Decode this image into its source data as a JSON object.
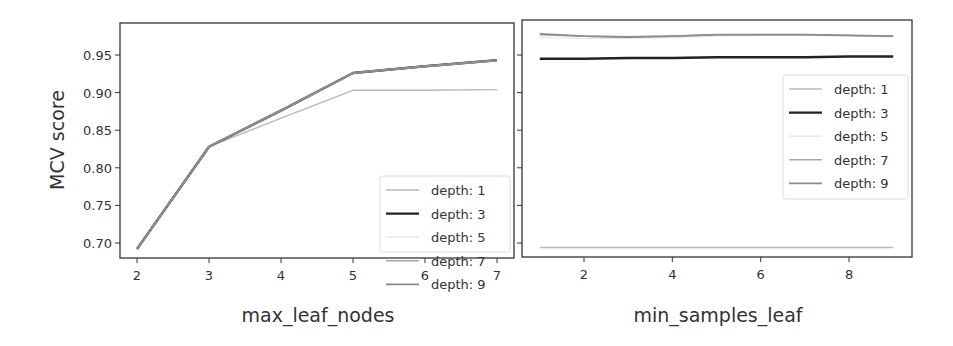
{
  "chart_data": [
    {
      "type": "line",
      "title": "",
      "xlabel": "max_leaf_nodes",
      "ylabel": "MCV score",
      "x": [
        2,
        3,
        4,
        5,
        6,
        7
      ],
      "xticks": [
        "2",
        "3",
        "4",
        "5",
        "6",
        "7"
      ],
      "yticks": [
        "0.70",
        "0.75",
        "0.80",
        "0.85",
        "0.90",
        "0.95"
      ],
      "ylim": [
        0.68,
        0.99
      ],
      "xlim": [
        1.75,
        7.2
      ],
      "grid": false,
      "legend_position": "lower right",
      "series": [
        {
          "name": "depth: 1",
          "color": "#b8b8b8",
          "values": [
            0.692,
            0.828,
            0.866,
            0.903,
            0.903,
            0.904
          ]
        },
        {
          "name": "depth: 3",
          "color": "#222222",
          "values": [
            0.692,
            0.828,
            0.876,
            0.926,
            0.935,
            0.943
          ]
        },
        {
          "name": "depth: 5",
          "color": "#e4e4e4",
          "values": [
            0.692,
            0.828,
            0.876,
            0.926,
            0.935,
            0.943
          ]
        },
        {
          "name": "depth: 7",
          "color": "#a8a8a8",
          "values": [
            0.692,
            0.828,
            0.876,
            0.926,
            0.935,
            0.943
          ]
        },
        {
          "name": "depth: 9",
          "color": "#8c8c8c",
          "values": [
            0.692,
            0.828,
            0.876,
            0.926,
            0.935,
            0.943
          ]
        }
      ]
    },
    {
      "type": "line",
      "title": "",
      "xlabel": "min_samples_leaf",
      "ylabel": "",
      "x": [
        1,
        2,
        3,
        4,
        5,
        6,
        7,
        8,
        9
      ],
      "xticks": [
        "2",
        "4",
        "6",
        "8"
      ],
      "ylim": [
        0.68,
        0.99
      ],
      "shared_y": true,
      "grid": false,
      "legend_position": "center right",
      "series": [
        {
          "name": "depth: 1",
          "color": "#b8b8b8",
          "values": [
            0.694,
            0.694,
            0.694,
            0.694,
            0.694,
            0.694,
            0.694,
            0.694,
            0.694
          ]
        },
        {
          "name": "depth: 3",
          "color": "#222222",
          "values": [
            0.945,
            0.945,
            0.946,
            0.946,
            0.947,
            0.947,
            0.947,
            0.948,
            0.948
          ]
        },
        {
          "name": "depth: 5",
          "color": "#e4e4e4",
          "values": [
            0.973,
            0.972,
            0.972,
            0.973,
            0.975,
            0.976,
            0.976,
            0.975,
            0.974
          ]
        },
        {
          "name": "depth: 7",
          "color": "#a8a8a8",
          "values": [
            0.977,
            0.975,
            0.974,
            0.975,
            0.977,
            0.977,
            0.977,
            0.976,
            0.975
          ]
        },
        {
          "name": "depth: 9",
          "color": "#8c8c8c",
          "values": [
            0.978,
            0.975,
            0.974,
            0.975,
            0.977,
            0.977,
            0.977,
            0.976,
            0.975
          ]
        }
      ]
    }
  ],
  "legend_labels": [
    "depth: 1",
    "depth: 3",
    "depth: 5",
    "depth: 7",
    "depth: 9"
  ]
}
